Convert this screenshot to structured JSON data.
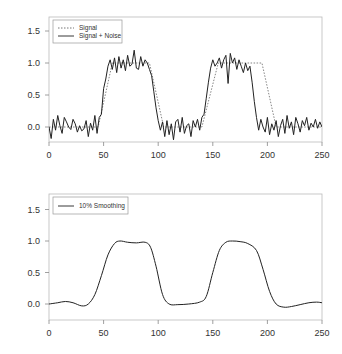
{
  "chart_data": [
    {
      "type": "line",
      "title": "",
      "xlabel": "",
      "ylabel": "",
      "xlim": [
        0,
        250
      ],
      "ylim": [
        -0.25,
        1.7
      ],
      "x_ticks": [
        0,
        50,
        100,
        150,
        200,
        250
      ],
      "y_ticks": [
        0.0,
        0.5,
        1.0,
        1.5
      ],
      "x_tick_labels": [
        "0",
        "50",
        "100",
        "150",
        "200",
        "250"
      ],
      "y_tick_labels": [
        "0.0",
        "0.5",
        "1.0",
        "1.5"
      ],
      "grid": false,
      "legend_position": "top-left",
      "legend": [
        "Signal",
        "Signal + Noise"
      ],
      "series": [
        {
          "name": "Signal",
          "style": "dotted",
          "x": [
            0,
            45,
            58,
            92,
            105,
            140,
            155,
            195,
            208,
            250
          ],
          "values": [
            0,
            0,
            1,
            1,
            0,
            0,
            1,
            1,
            0,
            0
          ]
        },
        {
          "name": "Signal + Noise",
          "style": "solid",
          "x_step": 2,
          "noise_amplitude": 0.15,
          "values": [
            0.0,
            -0.18,
            0.12,
            -0.05,
            0.18,
            0.02,
            -0.1,
            0.15,
            0.08,
            0.0,
            -0.04,
            0.12,
            0.05,
            -0.08,
            0.02,
            -0.06,
            -0.03,
            0.1,
            -0.15,
            0.06,
            -0.05,
            0.18,
            -0.1,
            0.15,
            0.2,
            0.6,
            0.75,
            0.95,
            1.05,
            0.9,
            1.08,
            0.85,
            1.1,
            0.92,
            1.05,
            0.88,
            1.12,
            0.95,
            0.98,
            1.2,
            0.92,
            0.9,
            1.1,
            0.95,
            1.05,
            1.0,
            0.9,
            0.8,
            0.55,
            0.3,
            0.1,
            -0.05,
            0.08,
            -0.15,
            0.1,
            -0.12,
            0.05,
            -0.2,
            0.08,
            0.12,
            -0.08,
            0.15,
            -0.1,
            0.02,
            0.05,
            -0.15,
            0.1,
            0.0,
            0.12,
            -0.05,
            0.15,
            0.2,
            0.45,
            0.7,
            0.92,
            1.05,
            0.95,
            1.0,
            1.08,
            0.92,
            1.05,
            1.12,
            0.68,
            1.15,
            1.0,
            1.08,
            0.9,
            1.05,
            0.95,
            0.85,
            1.0,
            0.88,
            0.95,
            0.7,
            0.4,
            0.15,
            -0.05,
            0.12,
            0.0,
            -0.08,
            0.15,
            -0.12,
            0.05,
            -0.05,
            0.1,
            -0.15,
            0.02,
            0.12,
            -0.1,
            0.18,
            -0.02,
            0.08,
            -0.12,
            0.15,
            0.05,
            -0.08,
            0.1,
            0.02,
            0.15,
            -0.05,
            0.06,
            0.0,
            0.12,
            -0.02,
            0.08,
            0.0
          ]
        }
      ]
    },
    {
      "type": "line",
      "title": "",
      "xlabel": "",
      "ylabel": "",
      "xlim": [
        0,
        250
      ],
      "ylim": [
        -0.25,
        1.7
      ],
      "x_ticks": [
        0,
        50,
        100,
        150,
        200,
        250
      ],
      "y_ticks": [
        0.0,
        0.5,
        1.0,
        1.5
      ],
      "x_tick_labels": [
        "0",
        "50",
        "100",
        "150",
        "200",
        "250"
      ],
      "y_tick_labels": [
        "0.0",
        "0.5",
        "1.0",
        "1.5"
      ],
      "grid": false,
      "legend_position": "top-left",
      "legend": [
        "10% Smoothing"
      ],
      "series": [
        {
          "name": "10% Smoothing",
          "style": "solid",
          "x": [
            0,
            8,
            15,
            22,
            30,
            36,
            42,
            48,
            54,
            60,
            65,
            72,
            80,
            88,
            93,
            98,
            104,
            110,
            118,
            128,
            138,
            144,
            150,
            156,
            162,
            168,
            175,
            182,
            190,
            196,
            202,
            208,
            215,
            222,
            230,
            238,
            245,
            250
          ],
          "values": [
            0.0,
            0.02,
            0.04,
            0.02,
            -0.03,
            0.0,
            0.15,
            0.45,
            0.78,
            0.96,
            1.0,
            0.98,
            0.97,
            0.98,
            0.9,
            0.6,
            0.15,
            0.0,
            -0.01,
            0.0,
            0.03,
            0.12,
            0.5,
            0.85,
            0.98,
            1.0,
            0.99,
            0.96,
            0.85,
            0.55,
            0.2,
            0.0,
            -0.05,
            -0.04,
            -0.01,
            0.02,
            0.03,
            0.02
          ]
        }
      ]
    }
  ]
}
